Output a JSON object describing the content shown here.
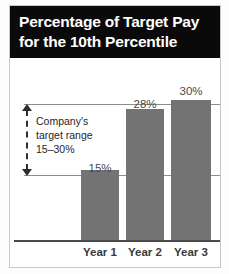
{
  "figure": {
    "title_lines": [
      "Percentage of Target Pay",
      "for the 10th Percentile"
    ],
    "title_background": "#0a0a0a",
    "title_color": "#ffffff"
  },
  "annotation": {
    "lines": [
      "Company's",
      "target range",
      "15–30%"
    ],
    "indicator_icon": "double-arrow-vertical-dashed-icon",
    "range_low": 15,
    "range_high": 30
  },
  "colors": {
    "bar": "#737373",
    "axis": "#4a4a4a",
    "reference_line": "#8d8d8d",
    "frame": "#c9c9c9",
    "page_background": "#ffffff"
  },
  "chart_data": {
    "type": "bar",
    "title": "Percentage of Target Pay for the 10th Percentile",
    "categories": [
      "Year 1",
      "Year 2",
      "Year 3"
    ],
    "values": [
      15,
      28,
      30
    ],
    "value_labels": [
      "15%",
      "28%",
      "30%"
    ],
    "xlabel": "",
    "ylabel": "",
    "ylim": [
      0,
      32
    ],
    "grid": false,
    "legend": false,
    "reference_lines": [
      {
        "name": "target-range-upper",
        "value": 30,
        "label": ""
      },
      {
        "name": "target-range-lower",
        "value": 15,
        "label": ""
      }
    ],
    "annotations": [
      {
        "name": "company-target-range",
        "text": "Company's target range 15–30%",
        "from_value": 15,
        "to_value": 30
      }
    ]
  }
}
